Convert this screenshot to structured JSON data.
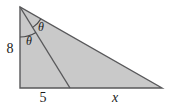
{
  "figure": {
    "type": "geometry-diagram",
    "background_color": "#ffffff"
  },
  "shape": {
    "name": "right-triangle",
    "fill_color": "#c9c9c9",
    "stroke_color": "#58585a",
    "stroke_width": 1.4,
    "vertices": {
      "apex": {
        "x": 20,
        "y": 7
      },
      "bottom_left": {
        "x": 20,
        "y": 88
      },
      "bottom_right": {
        "x": 162,
        "y": 88
      }
    }
  },
  "cevian": {
    "name": "interior-segment",
    "stroke_color": "#58585a",
    "stroke_width": 1.4,
    "from": {
      "x": 20,
      "y": 7
    },
    "to": {
      "x": 70,
      "y": 88
    }
  },
  "angles": [
    {
      "id": "theta-lower",
      "label": "θ",
      "label_x": 29,
      "label_y": 45,
      "description": "angle between the vertical leg and the cevian",
      "arc": {
        "cx": 20,
        "cy": 7,
        "radius": 30,
        "start_deg": 58,
        "end_deg": 90
      }
    },
    {
      "id": "theta-upper",
      "label": "θ",
      "label_x": 41,
      "label_y": 31,
      "description": "angle between the cevian and the hypotenuse",
      "arc": {
        "cx": 20,
        "cy": 7,
        "radius": 24,
        "start_deg": 29,
        "end_deg": 58
      }
    }
  ],
  "side_labels": [
    {
      "id": "leg-left",
      "text": "8",
      "style": "upright",
      "x": 10,
      "y": 53,
      "font_size": 14,
      "description": "length of the vertical left leg"
    },
    {
      "id": "base-left-segment",
      "text": "5",
      "style": "upright",
      "x": 43,
      "y": 102,
      "font_size": 14,
      "description": "length of the base from the right angle to the cevian foot"
    },
    {
      "id": "base-right-segment",
      "text": "x",
      "style": "italic",
      "x": 115,
      "y": 102,
      "font_size": 14,
      "description": "unknown length of the base from the cevian foot to the far vertex"
    }
  ]
}
